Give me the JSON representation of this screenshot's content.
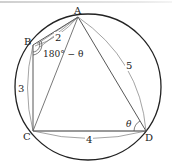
{
  "diagram": {
    "type": "cyclic-quadrilateral",
    "vertices": [
      "A",
      "B",
      "C",
      "D"
    ],
    "labels": {
      "A": "A",
      "B": "B",
      "C": "C",
      "D": "D"
    },
    "side_lengths": {
      "AB": "2",
      "BC": "3",
      "CD": "4",
      "DA": "5"
    },
    "angles": {
      "B": "180° − θ",
      "D": "θ"
    },
    "colors": {
      "stroke": "#222222",
      "thin_stroke": "#555555"
    }
  }
}
